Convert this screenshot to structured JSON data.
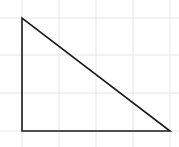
{
  "diagram": {
    "type": "right-triangle-on-grid",
    "grid": {
      "color": "#e6e6e6",
      "vertical_lines_x": [
        22,
        59,
        96,
        133,
        170
      ],
      "horizontal_lines_y": [
        18,
        55,
        93,
        131
      ]
    },
    "triangle": {
      "stroke": "#1a1a1a",
      "stroke_width": 1.6,
      "fill": "none",
      "vertices": [
        {
          "x": 22,
          "y": 18
        },
        {
          "x": 22,
          "y": 131
        },
        {
          "x": 170,
          "y": 131
        }
      ]
    }
  }
}
